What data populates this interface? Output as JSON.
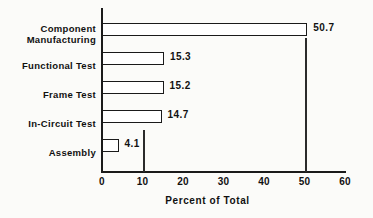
{
  "chart_data": {
    "type": "bar",
    "orientation": "horizontal",
    "title": "",
    "xlabel": "Percent of Total",
    "ylabel": "",
    "xlim": [
      0,
      60
    ],
    "xticks": [
      0,
      10,
      20,
      30,
      40,
      50,
      60
    ],
    "xtick_labels": [
      "0",
      "10",
      "20",
      "30",
      "40",
      "50",
      "60"
    ],
    "grid": false,
    "legend": null,
    "categories": [
      "Component\nManufacturing",
      "Functional Test",
      "Frame Test",
      "In-Circuit Test",
      "Assembly"
    ],
    "values": [
      50.7,
      15.3,
      15.2,
      14.7,
      4.1
    ],
    "value_labels": [
      "50.7",
      "15.3",
      "15.2",
      "14.7",
      "4.1"
    ],
    "bars": [
      {
        "category": "Component\nManufacturing",
        "value": 50.7,
        "label": "50.7"
      },
      {
        "category": "Functional Test",
        "value": 15.3,
        "label": "15.3"
      },
      {
        "category": "Frame Test",
        "value": 15.2,
        "label": "15.2"
      },
      {
        "category": "In-Circuit Test",
        "value": 14.7,
        "label": "14.7"
      },
      {
        "category": "Assembly",
        "value": 4.1,
        "label": "4.1"
      }
    ],
    "colors": {
      "bar_fill": "#ffffff",
      "bar_stroke": "#1a1a1a",
      "axis": "#1a1a1a",
      "text": "#111111",
      "background": "#fbfbf9"
    },
    "reference_lines": [
      10,
      50
    ]
  }
}
